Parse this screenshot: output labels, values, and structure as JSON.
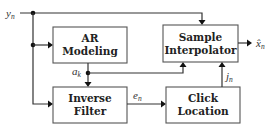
{
  "diagram": {
    "type": "block-diagram",
    "blocks": [
      {
        "id": "ar_modeling",
        "line1": "AR",
        "line2": "Modeling"
      },
      {
        "id": "sample_interpolator",
        "line1": "Sample",
        "line2": "Interpolator"
      },
      {
        "id": "inverse_filter",
        "line1": "Inverse",
        "line2": "Filter"
      },
      {
        "id": "click_location",
        "line1": "Click",
        "line2": "Location"
      }
    ],
    "signals": {
      "input": {
        "base": "y",
        "sub": "n"
      },
      "ar_coeffs": {
        "base": "a",
        "sub": "k"
      },
      "residual": {
        "base": "e",
        "sub": "n"
      },
      "click_positions": {
        "base": "j",
        "sub": "n"
      },
      "output": {
        "base": "x̂",
        "sub": "n"
      }
    },
    "edges": [
      {
        "from": "input",
        "to": "ar_modeling"
      },
      {
        "from": "input",
        "to": "inverse_filter"
      },
      {
        "from": "input",
        "to": "sample_interpolator"
      },
      {
        "from": "ar_modeling",
        "to": "inverse_filter",
        "label": "a_k"
      },
      {
        "from": "ar_modeling",
        "to": "sample_interpolator",
        "label": "a_k"
      },
      {
        "from": "inverse_filter",
        "to": "click_location",
        "label": "e_n"
      },
      {
        "from": "click_location",
        "to": "sample_interpolator",
        "label": "j_n"
      },
      {
        "from": "sample_interpolator",
        "to": "output",
        "label": "x̂_n"
      }
    ]
  }
}
